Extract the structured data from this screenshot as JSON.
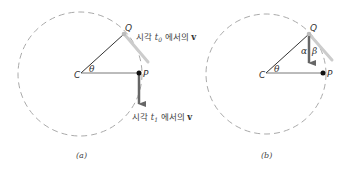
{
  "figure": {
    "panels": [
      {
        "id": "a",
        "caption": "(a)",
        "labels": {
          "center": "C",
          "point_q": "Q",
          "point_p": "P",
          "angle": "θ"
        },
        "annotations": {
          "t0_prefix": "시각 ",
          "t0_var": "t",
          "t0_sub": "0",
          "t0_suffix": " 에서의 ",
          "t0_vec": "v",
          "t1_prefix": "시각 ",
          "t1_var": "t",
          "t1_sub": "1",
          "t1_suffix": " 에서의 ",
          "t1_vec": "v"
        }
      },
      {
        "id": "b",
        "caption": "(b)",
        "labels": {
          "center": "C",
          "point_q": "Q",
          "point_p": "P",
          "angle": "θ",
          "alpha": "α",
          "beta": "β"
        }
      }
    ],
    "colors": {
      "circle": "#aaaaaa",
      "radius_line": "#333333",
      "velocity_dark": "#666666",
      "velocity_light": "#c8c8c8",
      "point": "#111111",
      "point_q": "#bbbbbb"
    }
  }
}
